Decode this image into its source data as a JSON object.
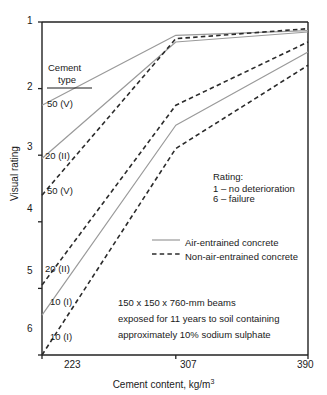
{
  "chart_data": {
    "type": "line",
    "title": "",
    "xlabel": "Cement content, kg/m3",
    "xlabel_base": "Cement content, kg/m",
    "xlabel_sup": "3",
    "ylabel": "Visual rating",
    "xticks": [
      223,
      307,
      390
    ],
    "xtick_labels": [
      "223",
      "307",
      "390"
    ],
    "yticks": [
      1,
      2,
      3,
      4,
      5,
      6
    ],
    "ytick_labels": [
      "1",
      "2",
      "3",
      "4",
      "5",
      "6"
    ],
    "xlim": [
      223,
      390
    ],
    "ylim": [
      1,
      6
    ],
    "y_inverted": true,
    "grid": false,
    "legend_position": "center-right",
    "legend": [
      {
        "label": "Air-entrained concrete",
        "style": "solid",
        "color": "#9a9a9a"
      },
      {
        "label": "Non-air-entrained concrete",
        "style": "dashed",
        "color": "#2b2b2b"
      }
    ],
    "series": [
      {
        "name": "50 (V) air-entrained",
        "cement_type": "50 (V)",
        "style": "solid",
        "x": [
          223,
          307,
          390
        ],
        "y": [
          2.25,
          1.2,
          1.13
        ]
      },
      {
        "name": "20 (II) air-entrained",
        "cement_type": "20 (II)",
        "style": "solid",
        "x": [
          223,
          307,
          390
        ],
        "y": [
          3.05,
          1.3,
          1.15
        ]
      },
      {
        "name": "50 (V) non-air-entrained",
        "cement_type": "50 (V)",
        "style": "dashed",
        "x": [
          223,
          307,
          390
        ],
        "y": [
          3.6,
          1.25,
          1.1
        ]
      },
      {
        "name": "20 (II) non-air-entrained",
        "cement_type": "20 (II)",
        "style": "dashed",
        "x": [
          223,
          307,
          390
        ],
        "y": [
          4.95,
          2.25,
          1.3
        ]
      },
      {
        "name": "10 (I) air-entrained",
        "cement_type": "10 (I)",
        "style": "solid",
        "x": [
          223,
          307,
          390
        ],
        "y": [
          5.4,
          2.55,
          1.45
        ]
      },
      {
        "name": "10 (I) non-air-entrained",
        "cement_type": "10 (I)",
        "style": "dashed",
        "x": [
          223,
          307,
          390
        ],
        "y": [
          6.0,
          2.9,
          1.65
        ]
      }
    ],
    "series_labels": [
      {
        "text": "50 (V)",
        "value": 2.25
      },
      {
        "text": "20 (II)",
        "value": 3.05
      },
      {
        "text": "50 (V)",
        "value": 3.6
      },
      {
        "text": "20 (II)",
        "value": 4.95
      },
      {
        "text": "10 (I)",
        "value": 5.4
      },
      {
        "text": "10 (I)",
        "value": 6.0
      }
    ],
    "annotations": {
      "cement_type_heading_line1": "Cement",
      "cement_type_heading_line2": "type",
      "rating_title": "Rating:",
      "rating_line1": "1 – no deterioration",
      "rating_line2": "6 – failure",
      "note_line1": "150 x 150 x 760-mm beams",
      "note_line2": "exposed for 11 years to soil containing",
      "note_line3": "approximately 10% sodium sulphate"
    }
  },
  "colors": {
    "axis": "#222222",
    "solid_line": "#9a9a9a",
    "dashed_line": "#2b2b2b",
    "text": "#1a1a1a",
    "background": "#ffffff"
  }
}
